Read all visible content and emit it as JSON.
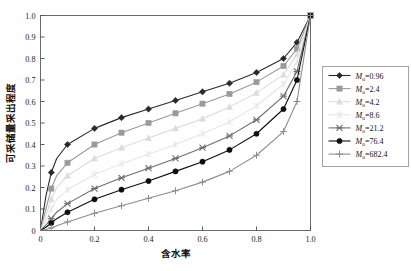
{
  "chart_data": {
    "type": "line",
    "title": "",
    "xlabel": "含水率",
    "ylabel": "可采储量采出程度",
    "xlim": [
      0,
      1.0
    ],
    "ylim": [
      0,
      1.0
    ],
    "xticks": [
      "0",
      "0.2",
      "0.4",
      "0.6",
      "0.8",
      "1.0"
    ],
    "xtick_values": [
      0,
      0.2,
      0.4,
      0.6,
      0.8,
      1.0
    ],
    "yticks": [
      "0",
      "0.1",
      "0.2",
      "0.3",
      "0.4",
      "0.5",
      "0.6",
      "0.7",
      "0.8",
      "0.9",
      "1.0"
    ],
    "ytick_values": [
      0,
      0.1,
      0.2,
      0.3,
      0.4,
      0.5,
      0.6,
      0.7,
      0.8,
      0.9,
      1.0
    ],
    "grid": false,
    "legend_position": "right-outside",
    "series": [
      {
        "name": "M_o=0.96",
        "label_prefix": "M",
        "label_sub": "o",
        "label_value": "=0.96",
        "color": "#2a2a2a",
        "marker": "diamond",
        "x": [
          0.0,
          0.02,
          0.04,
          0.06,
          0.1,
          0.2,
          0.3,
          0.4,
          0.5,
          0.6,
          0.7,
          0.8,
          0.9,
          0.95,
          1.0
        ],
        "y": [
          0.0,
          0.16,
          0.27,
          0.335,
          0.4,
          0.475,
          0.525,
          0.565,
          0.605,
          0.645,
          0.685,
          0.735,
          0.8,
          0.875,
          1.0
        ]
      },
      {
        "name": "M_o=2.4",
        "label_prefix": "M",
        "label_sub": "o",
        "label_value": "=2.4",
        "color": "#9a9a9a",
        "marker": "square",
        "x": [
          0.0,
          0.02,
          0.04,
          0.06,
          0.1,
          0.2,
          0.3,
          0.4,
          0.5,
          0.6,
          0.7,
          0.8,
          0.9,
          0.95,
          1.0
        ],
        "y": [
          0.0,
          0.1,
          0.195,
          0.255,
          0.315,
          0.4,
          0.455,
          0.5,
          0.545,
          0.59,
          0.635,
          0.69,
          0.765,
          0.845,
          1.0
        ]
      },
      {
        "name": "M_o=4.2",
        "label_prefix": "M",
        "label_sub": "o",
        "label_value": "=4.2",
        "color": "#dcdcdc",
        "marker": "triangle",
        "x": [
          0.0,
          0.02,
          0.04,
          0.06,
          0.1,
          0.2,
          0.3,
          0.4,
          0.5,
          0.6,
          0.7,
          0.8,
          0.9,
          0.95,
          1.0
        ],
        "y": [
          0.0,
          0.07,
          0.145,
          0.2,
          0.255,
          0.335,
          0.385,
          0.43,
          0.475,
          0.52,
          0.575,
          0.64,
          0.725,
          0.82,
          1.0
        ]
      },
      {
        "name": "M_o=8.6",
        "label_prefix": "M",
        "label_sub": "o",
        "label_value": "=8.6",
        "color": "#e6e6e6",
        "marker": "star6",
        "x": [
          0.0,
          0.02,
          0.04,
          0.06,
          0.1,
          0.2,
          0.3,
          0.4,
          0.5,
          0.6,
          0.7,
          0.8,
          0.9,
          0.95,
          1.0
        ],
        "y": [
          0.0,
          0.045,
          0.1,
          0.145,
          0.19,
          0.26,
          0.31,
          0.355,
          0.4,
          0.45,
          0.505,
          0.58,
          0.68,
          0.785,
          1.0
        ]
      },
      {
        "name": "M_o=21.2",
        "label_prefix": "M",
        "label_sub": "o",
        "label_value": "=21.2",
        "color": "#6e6e6e",
        "marker": "starX",
        "x": [
          0.0,
          0.02,
          0.04,
          0.06,
          0.1,
          0.2,
          0.3,
          0.4,
          0.5,
          0.6,
          0.7,
          0.8,
          0.9,
          0.95,
          1.0
        ],
        "y": [
          0.0,
          0.025,
          0.055,
          0.085,
          0.125,
          0.195,
          0.245,
          0.29,
          0.335,
          0.385,
          0.44,
          0.515,
          0.625,
          0.74,
          1.0
        ]
      },
      {
        "name": "M_o=76.4",
        "label_prefix": "M",
        "label_sub": "o",
        "label_value": "=76.4",
        "color": "#0d0d0d",
        "marker": "circle",
        "x": [
          0.0,
          0.02,
          0.04,
          0.06,
          0.1,
          0.2,
          0.3,
          0.4,
          0.5,
          0.6,
          0.7,
          0.8,
          0.9,
          0.95,
          1.0
        ],
        "y": [
          0.0,
          0.015,
          0.035,
          0.055,
          0.085,
          0.145,
          0.19,
          0.23,
          0.275,
          0.32,
          0.375,
          0.45,
          0.565,
          0.7,
          1.0
        ]
      },
      {
        "name": "M_o=682.4",
        "label_prefix": "M",
        "label_sub": "o",
        "label_value": "=682.4",
        "color": "#8e8e8e",
        "marker": "plus",
        "x": [
          0.0,
          0.02,
          0.04,
          0.06,
          0.1,
          0.2,
          0.3,
          0.4,
          0.5,
          0.6,
          0.7,
          0.8,
          0.9,
          0.95,
          1.0
        ],
        "y": [
          0.0,
          0.005,
          0.012,
          0.022,
          0.04,
          0.08,
          0.115,
          0.15,
          0.185,
          0.225,
          0.275,
          0.35,
          0.46,
          0.6,
          1.0
        ]
      }
    ]
  }
}
